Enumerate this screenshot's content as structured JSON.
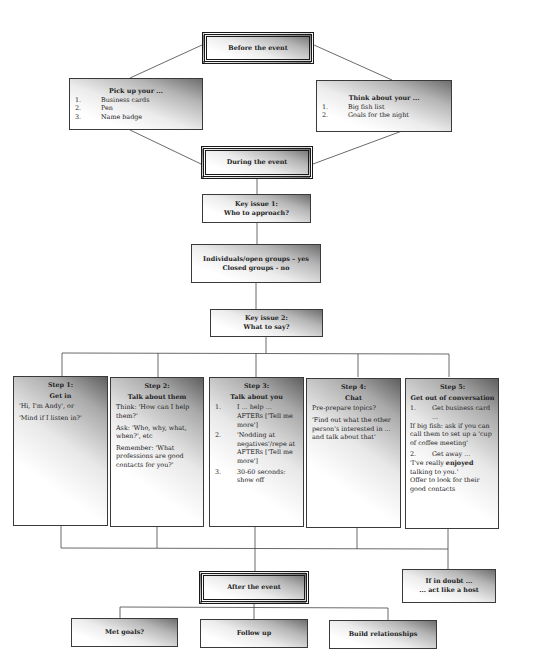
{
  "diagram": {
    "before": {
      "label": "Before the event"
    },
    "pickup": {
      "title": "Pick up your ...",
      "items": [
        {
          "num": "1.",
          "text": "Business cards"
        },
        {
          "num": "2.",
          "text": "Pen"
        },
        {
          "num": "3.",
          "text": "Name badge"
        }
      ]
    },
    "think": {
      "title": "Think about your ...",
      "items": [
        {
          "num": "1.",
          "text": "Big fish list"
        },
        {
          "num": "2.",
          "text": "Goals for the night"
        }
      ]
    },
    "during": {
      "label": "During the event"
    },
    "key1": {
      "line1": "Key issue 1:",
      "line2": "Who to approach?"
    },
    "groups": {
      "line1": "Individuals/open groups – yes",
      "line2": "Closed groups - no"
    },
    "key2": {
      "line1": "Key issue 2:",
      "line2": "What to say?"
    },
    "steps": [
      {
        "label": "Step 1:",
        "title": "Get in",
        "paras": [
          "'Hi, I'm Andy', or",
          "'Mind if I listen in?'"
        ]
      },
      {
        "label": "Step 2:",
        "title": "Talk about them",
        "paras": [
          "Think: 'How can I help them?'",
          "Ask: 'Who, why, what, when?', etc",
          "Remember: 'What professions are good contacts for you?'"
        ]
      },
      {
        "label": "Step 3:",
        "title": "Talk about you",
        "items": [
          {
            "num": "1.",
            "text": "I ... help ... AFTERs ['Tell me more']"
          },
          {
            "num": "2.",
            "text": "'Nodding at negatives'/repe at AFTERs ['Tell me more']"
          },
          {
            "num": "3.",
            "text": "30-60 seconds: show off"
          }
        ]
      },
      {
        "label": "Step 4:",
        "title": "Chat",
        "paras": [
          "Pre-prepare topics?",
          "'Find out what the other person's interested in ... and talk about that'"
        ]
      },
      {
        "label": "Step 5:",
        "title": "Get out of conversation",
        "item1": {
          "num": "1.",
          "text": "Get business card ..."
        },
        "para1": "If big fish: ask if you can call them to set up a 'cup of coffee meeting'",
        "item2": {
          "num": "2.",
          "text": "Get away ..."
        },
        "quote_pre": "'I've really ",
        "quote_bold": "enjoyed",
        "quote_post": " talking to you.'",
        "para2": "Offer to look for their good contacts"
      }
    ],
    "after": {
      "label": "After the event"
    },
    "doubt": {
      "line1": "If in doubt ...",
      "line2": "... act like a host"
    },
    "outcomes": [
      "Met goals?",
      "Follow up",
      "Build relationships"
    ]
  }
}
